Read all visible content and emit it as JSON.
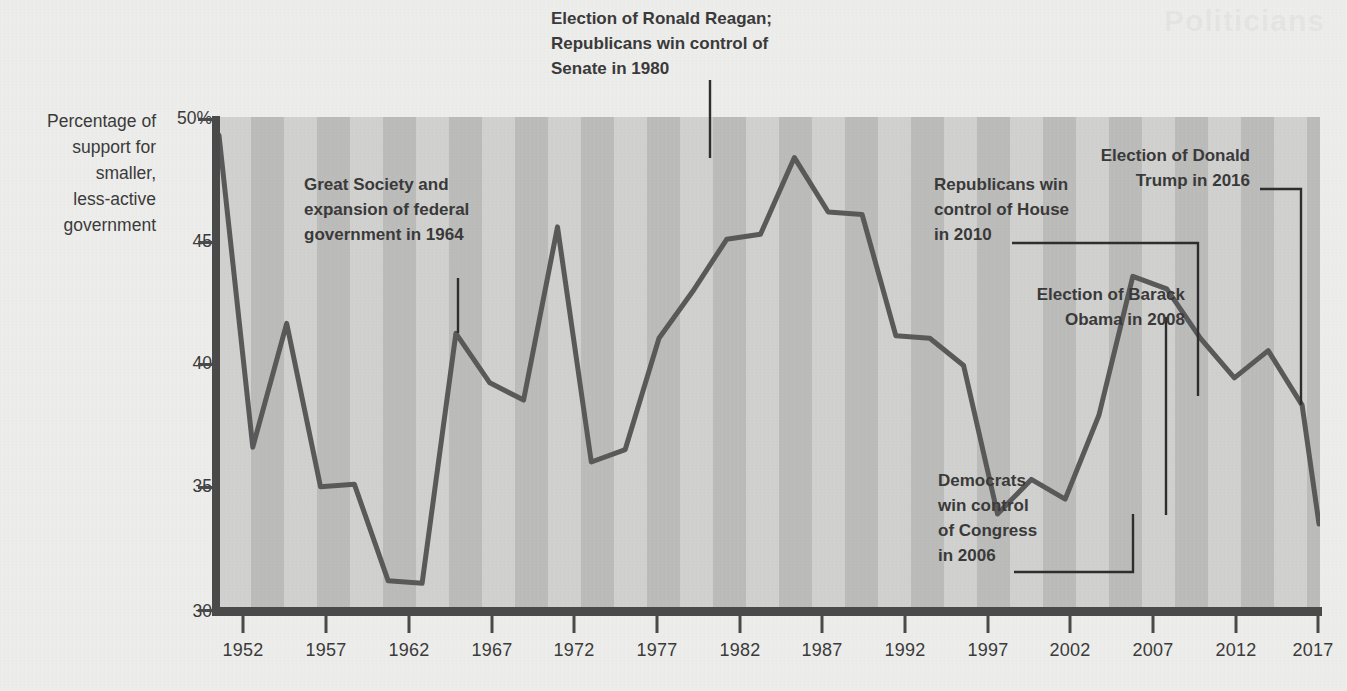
{
  "axis": {
    "y_caption": "Percentage of\nsupport for\nsmaller,\nless-active\ngovernment",
    "y_ticks": [
      "50%",
      "45",
      "40",
      "35",
      "30"
    ],
    "x_ticks": [
      "1952",
      "1957",
      "1962",
      "1967",
      "1972",
      "1977",
      "1982",
      "1987",
      "1992",
      "1997",
      "2002",
      "2007",
      "2012",
      "2017"
    ]
  },
  "annotations": [
    {
      "id": "great-society",
      "text": "Great Society and\nexpansion of federal\ngovernment in 1964"
    },
    {
      "id": "reagan",
      "text": "Election of Ronald Reagan;\nRepublicans win control of\nSenate in 1980"
    },
    {
      "id": "republicans-house",
      "text": "Republicans win\ncontrol of House\nin 2010"
    },
    {
      "id": "obama",
      "text": "Election of Barack\nObama in 2008"
    },
    {
      "id": "trump",
      "text": "Election of Donald\nTrump in 2016"
    },
    {
      "id": "democrats-congress",
      "text": "Democrats\nwin control\nof Congress\nin 2006"
    }
  ],
  "colors": {
    "line": "#5a5a5a",
    "axis": "#4a4a4a",
    "plot_background": "#d2d2d0",
    "band": "#bdbdbb",
    "page_background": "#eeeeec",
    "text": "#3b3b3b"
  },
  "chart_data": {
    "type": "line",
    "title": "",
    "subtitle": "",
    "xlabel": "",
    "ylabel": "Percentage of support for smaller, less-active government",
    "xlim": [
      1952,
      2017
    ],
    "ylim": [
      30,
      50
    ],
    "ytick_values": [
      30,
      35,
      40,
      45,
      50
    ],
    "xtick_values": [
      1952,
      1957,
      1962,
      1967,
      1972,
      1977,
      1982,
      1987,
      1992,
      1997,
      2002,
      2007,
      2012,
      2017
    ],
    "grid": false,
    "legend": "none",
    "series": [
      {
        "name": "Support for smaller, less-active government",
        "x": [
          1952,
          1954,
          1956,
          1958,
          1960,
          1962,
          1964,
          1966,
          1968,
          1970,
          1972,
          1974,
          1976,
          1978,
          1980,
          1982,
          1984,
          1986,
          1988,
          1990,
          1992,
          1994,
          1996,
          1998,
          2000,
          2002,
          2004,
          2006,
          2008,
          2010,
          2012,
          2014,
          2016,
          2017
        ],
        "y": [
          49.3,
          36.7,
          41.7,
          35.1,
          35.2,
          31.3,
          31.2,
          41.3,
          39.3,
          38.6,
          45.6,
          36.1,
          36.6,
          41.1,
          43.0,
          45.1,
          45.3,
          48.4,
          46.2,
          46.1,
          41.2,
          41.1,
          40.0,
          34.0,
          35.4,
          34.6,
          38.0,
          43.6,
          43.1,
          41.1,
          39.5,
          40.6,
          38.4,
          33.6
        ]
      }
    ],
    "annotations": [
      {
        "label": "Great Society and expansion of federal government in 1964",
        "x": 1964
      },
      {
        "label": "Election of Ronald Reagan; Republicans win control of Senate in 1980",
        "x": 1980
      },
      {
        "label": "Democrats win control of Congress in 2006",
        "x": 2006
      },
      {
        "label": "Election of Barack Obama in 2008",
        "x": 2008
      },
      {
        "label": "Republicans win control of House in 2010",
        "x": 2010
      },
      {
        "label": "Election of Donald Trump in 2016",
        "x": 2016
      }
    ]
  },
  "watermark": "Politicians"
}
